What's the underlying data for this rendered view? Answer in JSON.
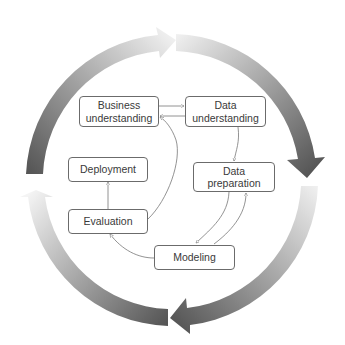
{
  "phases": [
    {
      "id": "business",
      "lines": [
        "Business",
        "understanding"
      ]
    },
    {
      "id": "data_understanding",
      "lines": [
        "Data",
        "understanding"
      ]
    },
    {
      "id": "data_preparation",
      "lines": [
        "Data",
        "preparation"
      ]
    },
    {
      "id": "modeling",
      "lines": [
        "Modeling"
      ]
    },
    {
      "id": "evaluation",
      "lines": [
        "Evaluation"
      ]
    },
    {
      "id": "deployment",
      "lines": [
        "Deployment"
      ]
    }
  ],
  "edges": [
    {
      "from": "Business understanding",
      "to": "Data understanding"
    },
    {
      "from": "Data understanding",
      "to": "Business understanding"
    },
    {
      "from": "Data understanding",
      "to": "Data preparation"
    },
    {
      "from": "Data preparation",
      "to": "Modeling"
    },
    {
      "from": "Modeling",
      "to": "Data preparation"
    },
    {
      "from": "Modeling",
      "to": "Evaluation"
    },
    {
      "from": "Evaluation",
      "to": "Business understanding"
    },
    {
      "from": "Evaluation",
      "to": "Deployment"
    }
  ],
  "outer_cycle": {
    "arrows": 4,
    "direction": "clockwise",
    "colors": {
      "light": "#f2f2f2",
      "dark": "#555555"
    }
  },
  "colors": {
    "box_border": "#6b6b6b",
    "text": "#3a3a3a",
    "edge": "#777777",
    "background": "#ffffff"
  }
}
